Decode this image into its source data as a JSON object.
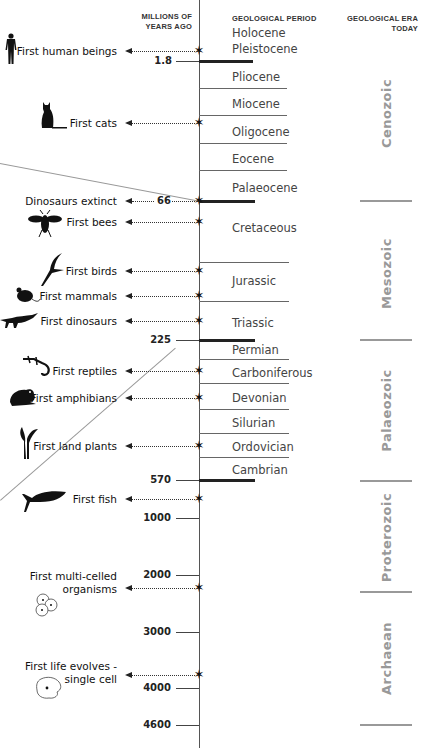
{
  "headers": {
    "mya": [
      "MILLIONS OF",
      "YEARS AGO"
    ],
    "period": "GEOLOGICAL PERIOD",
    "era": [
      "GEOLOGICAL ERA",
      "TODAY"
    ]
  },
  "periods": [
    {
      "name": "Holocene",
      "y": 5
    },
    {
      "name": "Pleistocene",
      "y": 41
    },
    {
      "name": "Pliocene",
      "y": 69
    },
    {
      "name": "Miocene",
      "y": 97
    },
    {
      "name": "Oligocene",
      "y": 125
    },
    {
      "name": "Eocene",
      "y": 152
    },
    {
      "name": "Palaeocene",
      "y": 181
    },
    {
      "name": "Cretaceous",
      "y": 221
    },
    {
      "name": "Jurassic",
      "y": 274
    },
    {
      "name": "Triassic",
      "y": 316
    },
    {
      "name": "Permian",
      "y": 343
    },
    {
      "name": "Carboniferous",
      "y": 367
    },
    {
      "name": "Devonian",
      "y": 392
    },
    {
      "name": "Silurian",
      "y": 417
    },
    {
      "name": "Ordovician",
      "y": 441
    },
    {
      "name": "Cambrian",
      "y": 464
    }
  ],
  "eras": [
    {
      "name": "Cenozoic",
      "center_y": 113
    },
    {
      "name": "Mesozoic",
      "center_y": 273
    },
    {
      "name": "Palaeozoic",
      "center_y": 410
    },
    {
      "name": "Proterozoic",
      "center_y": 537
    },
    {
      "name": "Archaean",
      "center_y": 658
    }
  ],
  "ticks": [
    {
      "label": "1.8",
      "y": 61
    },
    {
      "label": "66",
      "y": 201
    },
    {
      "label": "225",
      "y": 340
    },
    {
      "label": "570",
      "y": 480
    },
    {
      "label": "1000",
      "y": 518
    },
    {
      "label": "2000",
      "y": 575
    },
    {
      "label": "3000",
      "y": 632
    },
    {
      "label": "4000",
      "y": 688
    },
    {
      "label": "4600",
      "y": 725
    }
  ],
  "events": [
    {
      "label": "First human beings",
      "y": 51,
      "icon": "human-icon"
    },
    {
      "label": "First cats",
      "y": 123,
      "icon": "cat-icon"
    },
    {
      "label": "Dinosaurs extinct",
      "y": 201,
      "icon": ""
    },
    {
      "label": "First bees",
      "y": 222,
      "icon": "bee-icon"
    },
    {
      "label": "First birds",
      "y": 271,
      "icon": "bird-icon"
    },
    {
      "label": "First mammals",
      "y": 296,
      "icon": "mouse-icon"
    },
    {
      "label": "First dinosaurs",
      "y": 321,
      "icon": "dinosaur-icon"
    },
    {
      "label": "First reptiles",
      "y": 371,
      "icon": "lizard-icon"
    },
    {
      "label": "First amphibians",
      "y": 398,
      "icon": "frog-icon"
    },
    {
      "label": "First land plants",
      "y": 446,
      "icon": "plant-icon"
    },
    {
      "label": "First fish",
      "y": 499,
      "icon": "fish-icon"
    },
    {
      "label": "First multi-celled",
      "label2": "organisms",
      "y": 588,
      "icon": "multicell-icon"
    },
    {
      "label": "First life evolves -",
      "label2": "single cell",
      "y": 675,
      "icon": "single-cell-icon"
    }
  ],
  "colors": {
    "axis": "#555555",
    "era_text": "#999999",
    "thick_line": "#222222"
  }
}
